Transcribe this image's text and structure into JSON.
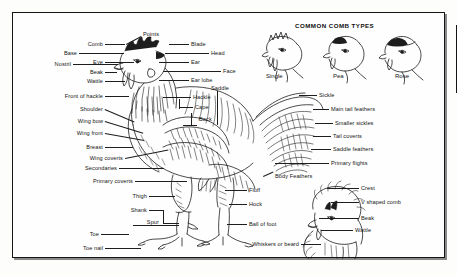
{
  "figure": {
    "comb_panel": {
      "heading": "COMMON COMB TYPES",
      "types": [
        {
          "name": "Single"
        },
        {
          "name": "Pea"
        },
        {
          "name": "Rose"
        }
      ]
    },
    "labels_left": [
      {
        "text": "Points"
      },
      {
        "text": "Comb"
      },
      {
        "text": "Base"
      },
      {
        "text": "Eye"
      },
      {
        "text": "Nostril"
      },
      {
        "text": "Beak"
      },
      {
        "text": "Wattle"
      },
      {
        "text": "Front of hackle"
      },
      {
        "text": "Shoulder"
      },
      {
        "text": "Wing bow"
      },
      {
        "text": "Wing front"
      },
      {
        "text": "Breast"
      },
      {
        "text": "Wing coverts"
      },
      {
        "text": "Secondaries"
      },
      {
        "text": "Primary coverts"
      },
      {
        "text": "Thigh"
      },
      {
        "text": "Shank"
      },
      {
        "text": "Spur"
      },
      {
        "text": "Toe"
      },
      {
        "text": "Toe nail"
      }
    ],
    "labels_head_right": [
      {
        "text": "Blade"
      },
      {
        "text": "Head"
      },
      {
        "text": "Ear"
      },
      {
        "text": "Face"
      },
      {
        "text": "Ear lobe"
      },
      {
        "text": "Hackle"
      },
      {
        "text": "Cape"
      },
      {
        "text": "Back"
      },
      {
        "text": "Saddle"
      }
    ],
    "labels_right": [
      {
        "text": "Sickle"
      },
      {
        "text": "Main tail feathers"
      },
      {
        "text": "Smaller sickles"
      },
      {
        "text": "Tail coverts"
      },
      {
        "text": "Saddle feathers"
      },
      {
        "text": "Primary flights"
      },
      {
        "text": "Body Feathers"
      },
      {
        "text": "Fluff"
      },
      {
        "text": "Hock"
      },
      {
        "text": "Ball of foot"
      }
    ],
    "labels_hen_head": [
      {
        "text": "Crest"
      },
      {
        "text": "V shaped comb"
      },
      {
        "text": "Beak"
      },
      {
        "text": "Wattle"
      },
      {
        "text": "Whiskers or beard"
      }
    ],
    "colors": {
      "ink": "#1d1d1d",
      "paper": "#fefefe",
      "frame": "#141414",
      "shadow": "#8a8a8a"
    }
  }
}
